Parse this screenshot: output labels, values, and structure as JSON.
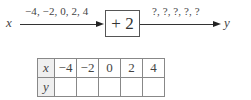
{
  "diagram": {
    "input_var": "x",
    "input_values": "−4, −2, 0, 2, 4",
    "function_box": "+ 2",
    "output_values": "?, ?, ?, ?, ?",
    "output_var": "y"
  },
  "table": {
    "rows": [
      {
        "header": "x",
        "cells": [
          "−4",
          "−2",
          "0",
          "2",
          "4"
        ]
      },
      {
        "header": "y",
        "cells": [
          "",
          "",
          "",
          "",
          ""
        ]
      }
    ]
  }
}
